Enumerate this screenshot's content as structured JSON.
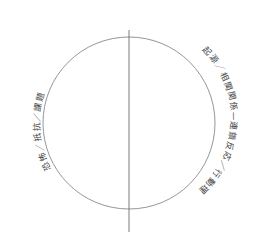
{
  "figure": {
    "type": "venn-like-circle-split",
    "background_color": "#ffffff",
    "stroke_color": "#8a8a8a",
    "text_color": "#3f3f3f",
    "circle": {
      "center_x": 129,
      "center_y": 123,
      "radius": 86
    },
    "divider": {
      "orientation": "vertical",
      "x": 129,
      "y_top": 30,
      "y_bottom": 232
    }
  },
  "labels": {
    "left_arc": "恐怖／抵抗／課題",
    "right_arc": "起源／相関関係—連鎖反応／行動理論"
  }
}
